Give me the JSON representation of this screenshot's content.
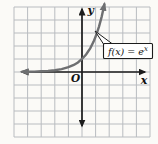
{
  "figure": {
    "background": "#fbfaf7",
    "colors": {
      "grid": "#b9bcc0",
      "axis": "#1c1c1c",
      "curve": "#6e6f71",
      "box_bg": "#ffffff",
      "box_border": "#1c1c1c",
      "text": "#111111"
    },
    "labels": {
      "y_axis": "y",
      "x_axis": "x",
      "origin": "O"
    },
    "annotation": {
      "text": "f(x) = e^x",
      "base": "f(x) = e",
      "exponent": "x"
    }
  },
  "chart_data": {
    "type": "line",
    "title": "",
    "xlabel": "x",
    "ylabel": "y",
    "xlim": [
      -5,
      5
    ],
    "ylim": [
      -5,
      5
    ],
    "grid": true,
    "grid_step": 1,
    "legend": "none",
    "series": [
      {
        "name": "f(x) = e^x",
        "x": [
          -4.4,
          -4.0,
          -3.5,
          -3.0,
          -2.5,
          -2.0,
          -1.5,
          -1.0,
          -0.6,
          -0.3,
          0,
          0.3,
          0.6,
          0.85,
          1.05,
          1.25,
          1.45,
          1.65
        ],
        "y": [
          0.012,
          0.018,
          0.03,
          0.05,
          0.082,
          0.135,
          0.223,
          0.368,
          0.549,
          0.741,
          1.0,
          1.35,
          1.822,
          2.34,
          2.858,
          3.49,
          4.263,
          5.207
        ]
      }
    ],
    "annotations": [
      {
        "text": "f(x) = e^x",
        "target_xy": [
          0.9,
          2.9
        ]
      }
    ]
  }
}
